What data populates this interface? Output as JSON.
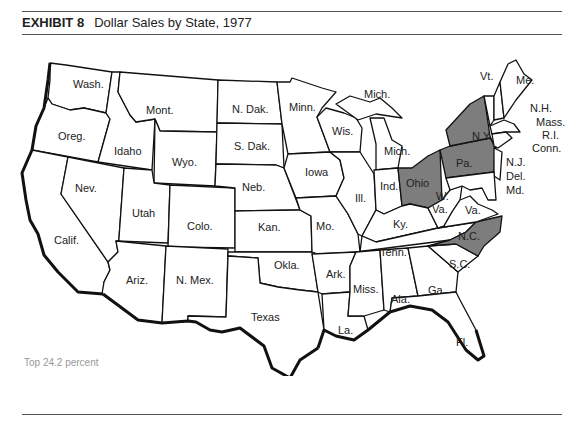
{
  "exhibit": {
    "label": "EXHIBIT 8",
    "title": "Dollar Sales by State, 1977"
  },
  "legend": {
    "text": "Top 24.2 percent",
    "highlight_color": "#7d7d7d"
  },
  "map": {
    "highlighted_states": [
      "N.Y.",
      "Pa.",
      "Ohio",
      "N.C."
    ],
    "labels": {
      "wash": "Wash.",
      "oreg": "Oreg.",
      "calif": "Calif.",
      "idaho": "Idaho",
      "nev": "Nev.",
      "mont": "Mont.",
      "wyo": "Wyo.",
      "utah": "Utah",
      "colo": "Colo.",
      "ariz": "Ariz.",
      "nmex": "N. Mex.",
      "ndak": "N. Dak.",
      "sdak": "S. Dak.",
      "neb": "Neb.",
      "kan": "Kan.",
      "okla": "Okla.",
      "texas": "Texas",
      "minn": "Minn.",
      "iowa": "Iowa",
      "mo": "Mo.",
      "ark": "Ark.",
      "la": "La.",
      "wis": "Wis.",
      "ill": "Ill.",
      "mich_up": "Mich.",
      "mich": "Mich.",
      "ind": "Ind.",
      "ohio": "Ohio",
      "ky": "Ky.",
      "tenn": "Tenn.",
      "miss": "Miss.",
      "ala": "Ala.",
      "ga": "Ga.",
      "fl": "Fl.",
      "sc": "S.C.",
      "nc": "N.C.",
      "va": "Va.",
      "wva1": "W.",
      "wva2": "Va.",
      "pa": "Pa.",
      "ny": "N.Y.",
      "vt": "Vt.",
      "me": "Me.",
      "nh": "N.H.",
      "mass": "Mass.",
      "ri": "R.I.",
      "conn": "Conn.",
      "nj": "N.J.",
      "del": "Del.",
      "md": "Md."
    }
  }
}
